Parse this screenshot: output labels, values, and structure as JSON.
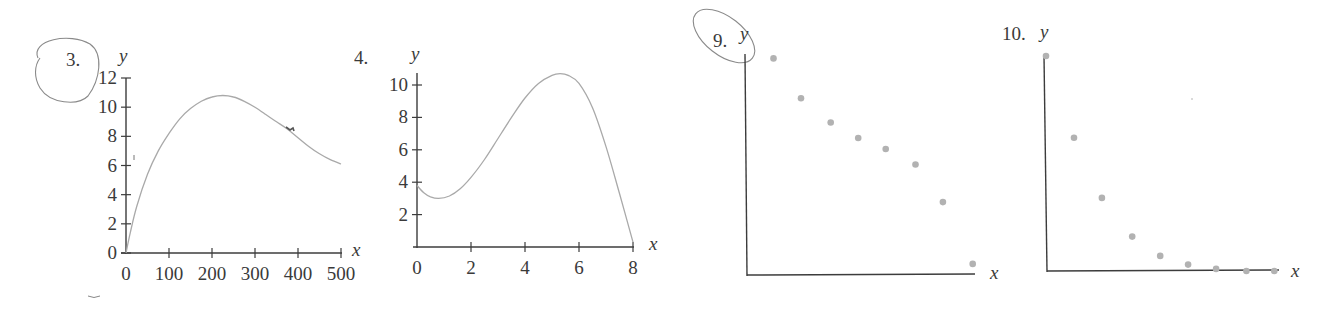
{
  "page": {
    "problems": [
      {
        "number_label": "3.",
        "annotated": true
      },
      {
        "number_label": "4.",
        "annotated": false
      },
      {
        "number_label": "9.",
        "annotated": true
      },
      {
        "number_label": "10.",
        "annotated": false
      }
    ]
  },
  "chart_data": [
    {
      "id": "problem-3",
      "type": "line",
      "title": "3.",
      "xlabel": "x",
      "ylabel": "y",
      "xlim": [
        0,
        500
      ],
      "ylim": [
        0,
        12
      ],
      "xticks": [
        0,
        100,
        200,
        300,
        400,
        500
      ],
      "yticks": [
        0,
        2,
        4,
        6,
        8,
        10,
        12
      ],
      "grid": false,
      "series": [
        {
          "name": "curve",
          "x": [
            0,
            10,
            25,
            50,
            75,
            100,
            125,
            150,
            175,
            200,
            225,
            250,
            275,
            300,
            325,
            350,
            375,
            400,
            425,
            450,
            475,
            500
          ],
          "y": [
            0,
            1.4,
            3.2,
            5.4,
            7.0,
            8.2,
            9.2,
            9.9,
            10.4,
            10.7,
            10.8,
            10.7,
            10.4,
            10.0,
            9.5,
            9.0,
            8.5,
            7.9,
            7.3,
            6.8,
            6.4,
            6.1
          ]
        }
      ],
      "pixel_frame": {
        "x0": 126,
        "x1": 341,
        "y0": 253,
        "y1": 78
      }
    },
    {
      "id": "problem-4",
      "type": "line",
      "title": "4.",
      "xlabel": "x",
      "ylabel": "y",
      "xlim": [
        0,
        8
      ],
      "ylim": [
        0,
        10
      ],
      "xticks": [
        0,
        2,
        4,
        6,
        8
      ],
      "yticks": [
        2,
        4,
        6,
        8,
        10
      ],
      "grid": false,
      "series": [
        {
          "name": "curve",
          "x": [
            0,
            0.25,
            0.5,
            0.8,
            1.2,
            1.6,
            2.0,
            2.5,
            3.0,
            3.5,
            4.0,
            4.5,
            5.0,
            5.3,
            5.6,
            6.0,
            6.5,
            7.0,
            7.5,
            8.0
          ],
          "y": [
            3.8,
            3.35,
            3.1,
            3.0,
            3.15,
            3.6,
            4.3,
            5.4,
            6.7,
            8.0,
            9.2,
            10.1,
            10.6,
            10.7,
            10.6,
            10.1,
            8.6,
            6.2,
            3.3,
            0.3
          ]
        }
      ],
      "pixel_frame": {
        "x0": 417,
        "x1": 633,
        "y0": 247,
        "y1": 85
      }
    },
    {
      "id": "problem-9",
      "type": "scatter",
      "title": "9.",
      "xlabel": "x",
      "ylabel": "y",
      "xticks": [],
      "yticks": [],
      "grid": false,
      "note": "unscaled axes; values are relative positions (0-1 of plot frame)",
      "series": [
        {
          "name": "points",
          "x": [
            0.12,
            0.24,
            0.37,
            0.49,
            0.61,
            0.74,
            0.86,
            0.99
          ],
          "y": [
            0.98,
            0.8,
            0.69,
            0.62,
            0.57,
            0.5,
            0.33,
            0.05
          ]
        }
      ],
      "pixel_frame": {
        "x0": 746,
        "x1": 975,
        "y0": 275,
        "y1": 54
      }
    },
    {
      "id": "problem-10",
      "type": "scatter",
      "title": "10.",
      "xlabel": "x",
      "ylabel": "y",
      "xticks": [],
      "yticks": [],
      "grid": false,
      "note": "unscaled axes; values are relative positions (0-1 of plot frame)",
      "series": [
        {
          "name": "points",
          "x": [
            0.0,
            0.12,
            0.24,
            0.37,
            0.49,
            0.61,
            0.73,
            0.86,
            0.98
          ],
          "y": [
            1.0,
            0.62,
            0.34,
            0.16,
            0.07,
            0.03,
            0.01,
            0.0,
            0.0
          ]
        }
      ],
      "pixel_frame": {
        "x0": 1046,
        "x1": 1279,
        "y0": 271,
        "y1": 56
      }
    }
  ]
}
